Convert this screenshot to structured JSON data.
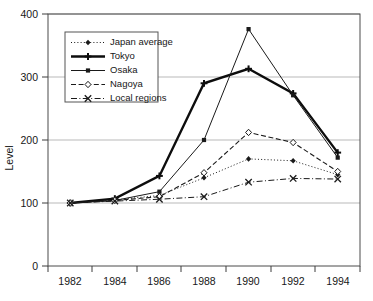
{
  "chart_data": {
    "type": "line",
    "title": "",
    "subtitle": "",
    "xlabel": "",
    "ylabel": "Level",
    "x": [
      1982,
      1984,
      1986,
      1988,
      1990,
      1992,
      1994
    ],
    "xtick_labels": [
      "1982",
      "1984",
      "1986",
      "1988",
      "1990",
      "1992",
      "1994"
    ],
    "ytick_labels": [
      "0",
      "100",
      "200",
      "300",
      "400"
    ],
    "yticks": [
      0,
      100,
      200,
      300,
      400
    ],
    "ylim": [
      0,
      400
    ],
    "xlim": [
      1981,
      1995
    ],
    "grid": "horizontal",
    "legend_position": "top-left-inside",
    "series": [
      {
        "name": "Japan average",
        "marker": "filled-diamond",
        "linestyle": "dotted",
        "color": "#1a1a1a",
        "values": [
          100,
          105,
          112,
          140,
          170,
          167,
          145
        ]
      },
      {
        "name": "Tokyo",
        "marker": "plus",
        "linestyle": "solid-thick",
        "color": "#0d0d0d",
        "values": [
          100,
          107,
          143,
          290,
          313,
          274,
          180
        ]
      },
      {
        "name": "Osaka",
        "marker": "filled-square",
        "linestyle": "solid",
        "color": "#1a1a1a",
        "values": [
          100,
          104,
          118,
          200,
          376,
          271,
          172
        ]
      },
      {
        "name": "Nagoya",
        "marker": "open-diamond",
        "linestyle": "dashed",
        "color": "#1a1a1a",
        "values": [
          100,
          104,
          110,
          148,
          212,
          196,
          150
        ]
      },
      {
        "name": "Local regions",
        "marker": "cross-x",
        "linestyle": "dash-dot",
        "color": "#1a1a1a",
        "values": [
          100,
          103,
          106,
          110,
          133,
          139,
          138
        ]
      }
    ]
  },
  "legend": {
    "entries": [
      {
        "label": "Japan average"
      },
      {
        "label": "Tokyo"
      },
      {
        "label": "Osaka"
      },
      {
        "label": "Nagoya"
      },
      {
        "label": "Local regions"
      }
    ]
  },
  "colors": {
    "axis": "#3d3d3d",
    "grid": "#b9b9b9",
    "ink": "#1a1a1a",
    "background": "#ffffff"
  }
}
